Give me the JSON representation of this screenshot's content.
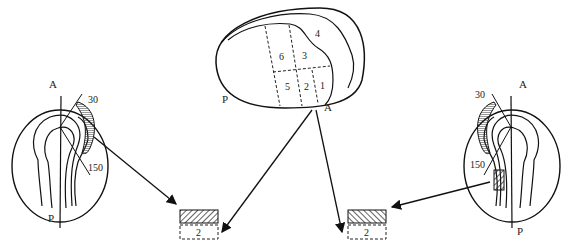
{
  "diagram": {
    "center_embryo": {
      "labels": {
        "posterior": "P",
        "anterior": "A",
        "top_region": "4"
      },
      "grid_cells": [
        "6",
        "3",
        "5",
        "2",
        "1"
      ]
    },
    "left_embryo": {
      "axis_top": "A",
      "axis_bottom": "P",
      "angle_start": "30",
      "angle_end": "150"
    },
    "right_embryo": {
      "axis_top": "A",
      "axis_bottom": "P",
      "angle_start": "30",
      "angle_end": "150"
    },
    "left_graft": {
      "lower_label": "2"
    },
    "right_graft": {
      "lower_label": "2"
    }
  }
}
